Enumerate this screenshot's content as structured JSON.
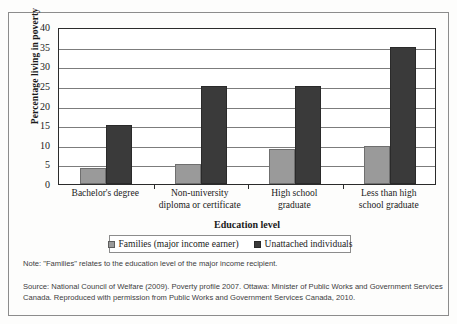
{
  "chart_data": {
    "type": "bar",
    "title": "",
    "xlabel": "Education level",
    "ylabel": "Percentage living in poverty",
    "ylim": [
      0,
      40
    ],
    "yticks": [
      0,
      5,
      10,
      15,
      20,
      25,
      30,
      35,
      40
    ],
    "grid": true,
    "legend_position": "bottom",
    "categories": [
      "Bachelor's degree",
      "Non-university\ndiploma or certificate",
      "High school\ngraduate",
      "Less than high\nschool graduate"
    ],
    "category_lines": [
      [
        "Bachelor's degree",
        ""
      ],
      [
        "Non-university",
        "diploma or certificate"
      ],
      [
        "High school",
        "graduate"
      ],
      [
        "Less than high",
        "school graduate"
      ]
    ],
    "series": [
      {
        "name": "Families (major income earner)",
        "color": "#9a9a9a",
        "values": [
          4,
          5.2,
          9,
          9.7
        ]
      },
      {
        "name": "Unattached individuals",
        "color": "#3a3a3a",
        "values": [
          15,
          25,
          25,
          35
        ]
      }
    ]
  },
  "notes": {
    "note": "Note: \"Families\" relates to the education level of the major income recipient.",
    "source": "Source: National Council of Welfare (2009). Poverty profile 2007. Ottawa: Minister of Public Works and Government Services Canada. Reproduced with permission from Public Works and Government Services Canada, 2010."
  }
}
